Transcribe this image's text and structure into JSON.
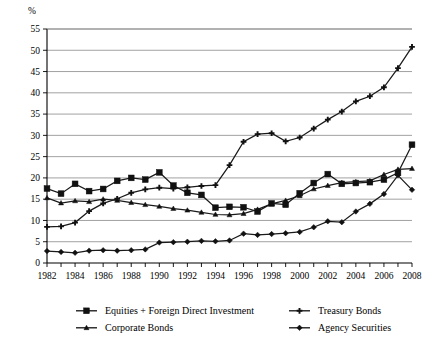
{
  "chart_data": {
    "type": "line",
    "title": "",
    "xlabel": "",
    "ylabel": "%",
    "ylim": [
      0,
      55
    ],
    "xlim": [
      1982,
      2008
    ],
    "grid": true,
    "legend_position": "bottom",
    "yticks": [
      0,
      5,
      10,
      15,
      20,
      25,
      30,
      35,
      40,
      45,
      50,
      55
    ],
    "xticks": [
      1982,
      1984,
      1986,
      1988,
      1990,
      1992,
      1994,
      1996,
      1998,
      2000,
      2002,
      2004,
      2006,
      2008
    ],
    "x": [
      1982,
      1983,
      1984,
      1985,
      1986,
      1987,
      1988,
      1989,
      1990,
      1991,
      1992,
      1993,
      1994,
      1995,
      1996,
      1997,
      1998,
      1999,
      2000,
      2001,
      2002,
      2003,
      2004,
      2005,
      2006,
      2007,
      2008
    ],
    "series": [
      {
        "name": "Equities + Foreign Direct Investment",
        "marker": "square",
        "values": [
          17.5,
          16.3,
          18.6,
          16.9,
          17.4,
          19.3,
          20.0,
          19.6,
          21.3,
          18.2,
          16.5,
          16.0,
          13.0,
          13.2,
          13.1,
          12.1,
          14.0,
          13.7,
          16.4,
          18.8,
          20.9,
          18.6,
          18.8,
          19.0,
          19.6,
          21.2,
          27.8
        ]
      },
      {
        "name": "Corporate Bonds",
        "marker": "triangle",
        "values": [
          15.3,
          14.1,
          14.6,
          14.4,
          15.0,
          14.7,
          14.2,
          13.7,
          13.3,
          12.8,
          12.4,
          11.9,
          11.4,
          11.3,
          11.6,
          12.6,
          13.9,
          14.7,
          15.8,
          17.4,
          18.2,
          18.9,
          19.1,
          19.3,
          20.8,
          22.0,
          22.2
        ]
      },
      {
        "name": "Treasury Bonds",
        "marker": "plus",
        "values": [
          8.5,
          8.6,
          9.5,
          12.2,
          14.0,
          15.1,
          16.5,
          17.3,
          17.7,
          17.5,
          17.8,
          18.1,
          18.3,
          23.0,
          28.5,
          30.3,
          30.5,
          28.6,
          29.5,
          31.6,
          33.7,
          35.6,
          38.0,
          39.2,
          41.3,
          45.8,
          50.8
        ]
      },
      {
        "name": "Agency Securities",
        "marker": "diamond",
        "values": [
          2.8,
          2.6,
          2.4,
          2.9,
          3.0,
          2.9,
          3.0,
          3.2,
          4.8,
          4.9,
          5.0,
          5.2,
          5.1,
          5.3,
          6.9,
          6.6,
          6.8,
          7.0,
          7.3,
          8.4,
          9.8,
          9.6,
          12.1,
          13.9,
          16.2,
          20.6,
          17.2
        ]
      }
    ],
    "legend": [
      {
        "label": "Equities + Foreign Direct Investment",
        "marker": "square"
      },
      {
        "label": "Corporate Bonds",
        "marker": "triangle"
      },
      {
        "label": "Treasury Bonds",
        "marker": "plus"
      },
      {
        "label": "Agency Securities",
        "marker": "diamond"
      }
    ],
    "colors": {
      "line": "#1a1a1a",
      "grid": "#7a7a7a",
      "axis": "#000000",
      "background": "#ffffff"
    }
  }
}
